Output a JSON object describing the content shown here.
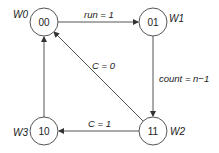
{
  "diagram": {
    "type": "state-machine",
    "states": [
      {
        "id": "00",
        "code": "00",
        "name": "W0"
      },
      {
        "id": "01",
        "code": "01",
        "name": "W1"
      },
      {
        "id": "11",
        "code": "11",
        "name": "W2"
      },
      {
        "id": "10",
        "code": "10",
        "name": "W3"
      }
    ],
    "transitions": [
      {
        "from": "00",
        "to": "01",
        "label": "run = 1"
      },
      {
        "from": "01",
        "to": "11",
        "label": "count = n−1"
      },
      {
        "from": "11",
        "to": "10",
        "label": "C = 1"
      },
      {
        "from": "11",
        "to": "00",
        "label": "C = 0"
      },
      {
        "from": "10",
        "to": "00",
        "label": ""
      }
    ],
    "colors": {
      "stroke": "#555555",
      "text": "#222222",
      "background": "#ffffff"
    }
  }
}
